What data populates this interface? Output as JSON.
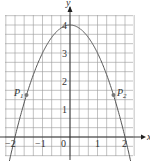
{
  "chart_data": {
    "type": "line",
    "title": "",
    "function": "y = 4 - x^2",
    "xlabel": "x",
    "ylabel": "y",
    "xlim": [
      -2.4,
      2.3
    ],
    "ylim": [
      -0.6,
      4.5
    ],
    "x_ticks": [
      "-2",
      "-1",
      "0",
      "1",
      "2"
    ],
    "y_ticks": [
      "1",
      "2",
      "3",
      "4"
    ],
    "grid": true,
    "grid_step": 0.333,
    "series": [
      {
        "name": "parabola",
        "x": [
          -2.2,
          -2,
          -1.5,
          -1,
          -0.5,
          0,
          0.5,
          1,
          1.5,
          2,
          2.2
        ],
        "y": [
          -0.84,
          0,
          1.75,
          3,
          3.75,
          4,
          3.75,
          3,
          1.75,
          0,
          -0.84
        ]
      }
    ],
    "points": [
      {
        "label": "P1",
        "x": -1.58,
        "y": 1.5
      },
      {
        "label": "P2",
        "x": 1.58,
        "y": 1.5
      }
    ]
  },
  "labels": {
    "x_axis": "x",
    "y_axis": "y",
    "p1": "P",
    "p1_sub": "1",
    "p2": "P",
    "p2_sub": "2",
    "t_m2": "−2",
    "t_m1": "−1",
    "t_0": "0",
    "t_1": "1",
    "t_2": "2",
    "y_1": "1",
    "y_2": "2",
    "y_3": "3",
    "y_4": "4"
  }
}
